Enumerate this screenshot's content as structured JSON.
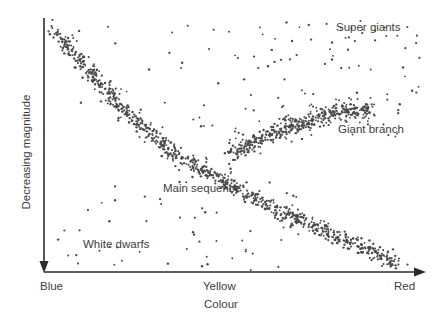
{
  "chart_data": {
    "type": "scatter",
    "title": "",
    "subtitle": "",
    "xlabel": "Colour",
    "ylabel": "Decreasing magnitude",
    "xtick_labels": [
      "Blue",
      "Yellow",
      "Red"
    ],
    "ytick_labels": [],
    "grid": false,
    "legend_position": "none",
    "axis_style": {
      "x_axis": "arrow-right",
      "y_axis": "arrow-down",
      "x_range_px": [
        44,
        425
      ],
      "y_range_px": [
        18,
        272
      ],
      "color": "#2b2b2b"
    },
    "annotations": [
      {
        "name": "super-giants",
        "text": "Super giants",
        "x_px": 336,
        "y_px": 22
      },
      {
        "name": "giant-branch",
        "text": "Giant branch",
        "x_px": 338,
        "y_px": 124
      },
      {
        "name": "main-sequence",
        "text": "Main sequence",
        "x_px": 163,
        "y_px": 183
      },
      {
        "name": "white-dwarfs",
        "text": "White dwarfs",
        "x_px": 83,
        "y_px": 239
      }
    ],
    "series": [
      {
        "name": "Main sequence",
        "description": "Dense diagonal band of stars running from hot blue bright upper-left to cool red faint lower-right",
        "point_count": 900,
        "marker_color": "#4a4a4a",
        "marker_size_px": 1.3,
        "band_path_px": [
          [
            52,
            26
          ],
          [
            80,
            60
          ],
          [
            110,
            95
          ],
          [
            140,
            125
          ],
          [
            170,
            150
          ],
          [
            205,
            172
          ],
          [
            240,
            190
          ],
          [
            275,
            208
          ],
          [
            310,
            224
          ],
          [
            345,
            240
          ],
          [
            380,
            255
          ],
          [
            402,
            266
          ]
        ],
        "band_halfwidth_px": 9
      },
      {
        "name": "Giant branch",
        "description": "Dense cluster sweeping upward to the right above the main sequence",
        "point_count": 430,
        "marker_color": "#4a4a4a",
        "marker_size_px": 1.3,
        "band_path_px": [
          [
            232,
            152
          ],
          [
            252,
            143
          ],
          [
            272,
            134
          ],
          [
            292,
            126
          ],
          [
            312,
            119
          ],
          [
            332,
            113
          ],
          [
            352,
            110
          ],
          [
            372,
            110
          ]
        ],
        "band_halfwidth_px": 11
      },
      {
        "name": "Super giants",
        "description": "Sparse scattered points across the upper region of the diagram",
        "point_count": 120,
        "marker_color": "#4a4a4a",
        "marker_size_px": 1.3,
        "region_px": {
          "x0": 60,
          "y0": 20,
          "x1": 425,
          "y1": 140
        }
      },
      {
        "name": "White dwarfs",
        "description": "Sparse scattered points in the lower-left region below the main sequence",
        "point_count": 55,
        "marker_color": "#4a4a4a",
        "marker_size_px": 1.3,
        "region_px": {
          "x0": 55,
          "y0": 180,
          "x1": 300,
          "y1": 270
        }
      }
    ]
  }
}
